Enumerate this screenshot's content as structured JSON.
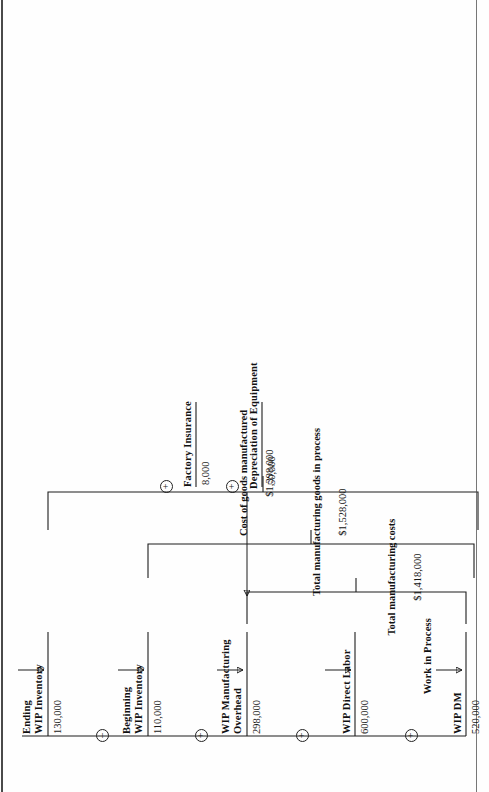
{
  "diagram": {
    "title": "Work in Process",
    "type": "cost-of-goods-manufactured-flow",
    "accounts": [
      {
        "id": "wip_dm",
        "label": "WIP DM",
        "value": "520,000"
      },
      {
        "id": "wip_dl",
        "label": "WIP Direct Labor",
        "value": "600,000"
      },
      {
        "id": "wip_moh",
        "label": "WIP Manufacturing\nOverhead",
        "value": "298,000"
      },
      {
        "id": "beg_wip",
        "label": "Beginning\nWIP Inventory",
        "value": "110,000"
      },
      {
        "id": "end_wip",
        "label": "Ending\nWIP Inventory",
        "value": "130,000"
      }
    ],
    "inputs": [
      {
        "id": "factory_insurance",
        "label": "Factory Insurance",
        "value": "8,000"
      },
      {
        "id": "depreciation",
        "label": "Depreciation of Equipment",
        "value": "50,000"
      }
    ],
    "operators": [
      {
        "id": "op_dm_dl",
        "symbol": "+"
      },
      {
        "id": "op_dl_moh",
        "symbol": "+"
      },
      {
        "id": "op_moh_beg",
        "symbol": "+"
      },
      {
        "id": "op_beg_end",
        "symbol": "–"
      },
      {
        "id": "op_ins",
        "symbol": "+"
      },
      {
        "id": "op_dep",
        "symbol": "+"
      }
    ],
    "totals": [
      {
        "id": "total_mfg_costs",
        "label": "Total manufacturing costs",
        "value": "$1,418,000"
      },
      {
        "id": "total_goods_ip",
        "label": "Total manufacturing goods in process",
        "value": "$1,528,000"
      },
      {
        "id": "cogm",
        "label": "Cost of goods manufactured",
        "value": "$1,398,000"
      }
    ]
  }
}
